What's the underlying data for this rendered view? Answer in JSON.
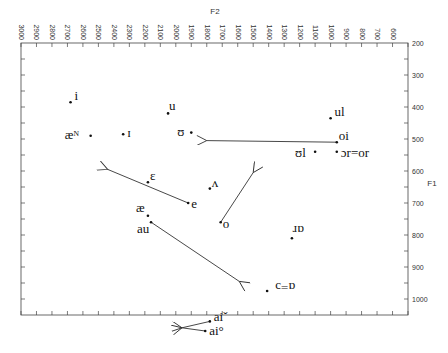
{
  "chart_data": {
    "type": "scatter",
    "title": "",
    "xlabel": "F2",
    "ylabel": "F1",
    "xlim": [
      3000,
      500
    ],
    "ylim": [
      1000,
      200
    ],
    "x_reversed": true,
    "y_reversed": true,
    "x_axis_position": "top",
    "y_axis_position": "right",
    "grid": false,
    "x_ticks": [
      "3000",
      "2900",
      "2800",
      "2700",
      "2600",
      "2500",
      "2400",
      "2300",
      "2200",
      "2100",
      "2000",
      "1900",
      "1800",
      "1700",
      "1600",
      "1500",
      "1400",
      "1300",
      "1200",
      "1100",
      "1000",
      "900",
      "800",
      "700",
      "600",
      "500"
    ],
    "y_ticks": [
      "200",
      "300",
      "400",
      "500",
      "600",
      "700",
      "800",
      "900",
      "1000"
    ],
    "points": [
      {
        "label": "i",
        "F2": 2680,
        "F1": 385
      },
      {
        "label": "æᴺ",
        "F2": 2550,
        "F1": 490
      },
      {
        "label": "ɪ",
        "F2": 2340,
        "F1": 485
      },
      {
        "label": "u",
        "F2": 2050,
        "F1": 420
      },
      {
        "label": "ʊ",
        "F2": 1900,
        "F1": 480
      },
      {
        "label": "ul",
        "F2": 1000,
        "F1": 435
      },
      {
        "label": "oi",
        "F2": 960,
        "F1": 510
      },
      {
        "label": "ʊl",
        "F2": 1100,
        "F1": 540
      },
      {
        "label": "ɔr=or",
        "F2": 960,
        "F1": 540
      },
      {
        "label": "ɛ",
        "F2": 2180,
        "F1": 635
      },
      {
        "label": "ʌ",
        "F2": 1780,
        "F1": 655
      },
      {
        "label": "e",
        "F2": 1920,
        "F1": 700
      },
      {
        "label": "æ",
        "F2": 2180,
        "F1": 740
      },
      {
        "label": "au",
        "F2": 2160,
        "F1": 760
      },
      {
        "label": "o",
        "F2": 1710,
        "F1": 760
      },
      {
        "label": "ɑr",
        "F2": 1250,
        "F1": 810
      },
      {
        "label": "ɑ=ɔ",
        "F2": 1410,
        "F1": 975
      },
      {
        "label": "aiˇ",
        "F2": 1780,
        "F1": 1070
      },
      {
        "label": "ai°",
        "F2": 1810,
        "F1": 1100
      }
    ],
    "arrows": [
      {
        "from": "oi",
        "from_xy": [
          960,
          510
        ],
        "to_xy": [
          1800,
          505
        ]
      },
      {
        "from": "e",
        "from_xy": [
          1920,
          700
        ],
        "to_xy": [
          2440,
          595
        ]
      },
      {
        "from": "o",
        "from_xy": [
          1710,
          760
        ],
        "to_xy": [
          1500,
          605
        ]
      },
      {
        "from": "au",
        "from_xy": [
          2160,
          760
        ],
        "to_xy": [
          1590,
          945
        ]
      },
      {
        "from": "aiˇ",
        "from_xy": [
          1780,
          1070
        ],
        "to_xy": [
          1960,
          1090
        ]
      },
      {
        "from": "ai°",
        "from_xy": [
          1810,
          1100
        ],
        "to_xy": [
          1960,
          1090
        ]
      }
    ]
  }
}
